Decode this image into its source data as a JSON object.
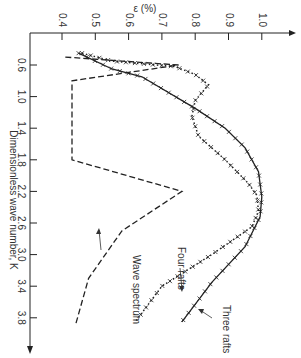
{
  "chart_data": {
    "type": "line",
    "title": "",
    "orientation": "rotated 90 degrees clockwise (epsilon on top horizontal axis, K on left vertical axis pointing down)",
    "xlabel": "ε (%)",
    "ylabel": "Dimensionless wave number, K",
    "xlim": [
      0.4,
      1.05
    ],
    "ylim": [
      0.4,
      4.0
    ],
    "x_ticks": [
      "0.4",
      "0.5",
      "0.6",
      "0.7",
      "0.8",
      "0.9",
      "1.0"
    ],
    "y_ticks": [
      "0.6",
      "1.0",
      "1.4",
      "1.8",
      "2.2",
      "2.6",
      "3.0",
      "3.4",
      "3.8"
    ],
    "grid": false,
    "legend_position": "inline annotations",
    "series": [
      {
        "name": "Three rafts",
        "style": "solid with x markers",
        "points": [
          [
            0.45,
            0.45
          ],
          [
            0.55,
            0.65
          ],
          [
            0.64,
            0.75
          ],
          [
            0.8,
            1.15
          ],
          [
            0.89,
            1.4
          ],
          [
            0.95,
            1.65
          ],
          [
            0.99,
            1.95
          ],
          [
            1.0,
            2.27
          ],
          [
            0.995,
            2.52
          ],
          [
            0.95,
            2.9
          ],
          [
            0.85,
            3.35
          ],
          [
            0.76,
            3.85
          ]
        ]
      },
      {
        "name": "Four rafts",
        "style": "dotted with x markers",
        "points": [
          [
            0.46,
            0.45
          ],
          [
            0.55,
            0.55
          ],
          [
            0.74,
            0.62
          ],
          [
            0.8,
            0.72
          ],
          [
            0.84,
            0.85
          ],
          [
            0.8,
            1.05
          ],
          [
            0.79,
            1.25
          ],
          [
            0.81,
            1.5
          ],
          [
            0.89,
            1.8
          ],
          [
            0.96,
            2.1
          ],
          [
            0.985,
            2.25
          ],
          [
            0.99,
            2.45
          ],
          [
            0.97,
            2.65
          ],
          [
            0.85,
            3.0
          ],
          [
            0.7,
            3.4
          ],
          [
            0.62,
            3.85
          ]
        ]
      },
      {
        "name": "Wave spectrum",
        "style": "dashed",
        "points": [
          [
            0.41,
            0.5
          ],
          [
            0.75,
            0.6
          ],
          [
            0.43,
            0.8
          ],
          [
            0.43,
            1.8
          ],
          [
            0.76,
            2.2
          ],
          [
            0.58,
            2.7
          ],
          [
            0.48,
            3.3
          ],
          [
            0.44,
            3.9
          ]
        ]
      }
    ],
    "annotations": [
      "Three rafts",
      "Four rafts",
      "Wave spectrum"
    ]
  },
  "labels": {
    "x_axis_title": "ε (%)",
    "y_axis_title": "Dimensionless wave number, K",
    "three_rafts": "Three rafts",
    "four_rafts": "Four rafts",
    "wave_spectrum": "Wave spectrum"
  }
}
